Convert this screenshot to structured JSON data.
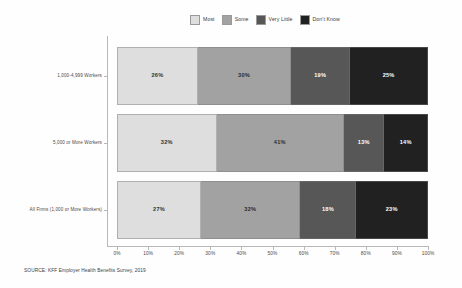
{
  "chart_data": {
    "type": "bar",
    "orientation": "horizontal",
    "stacked": true,
    "title": "",
    "subtitle": "",
    "xlabel": "",
    "ylabel": "",
    "xlim": [
      0,
      100
    ],
    "grid": false,
    "legend_position": "top",
    "categories": [
      "1,000-4,999 Workers",
      "5,000 or More Workers",
      "All Firms (1,000 or More Workers)"
    ],
    "series": [
      {
        "name": "Most",
        "color": "#dedede",
        "text_color": "#333333",
        "values": [
          26,
          32,
          27
        ]
      },
      {
        "name": "Some",
        "color": "#a2a2a2",
        "text_color": "#2b2b2b",
        "values": [
          30,
          41,
          32
        ]
      },
      {
        "name": "Very Little",
        "color": "#575757",
        "text_color": "#ffffff",
        "values": [
          19,
          13,
          18
        ]
      },
      {
        "name": "Don't Know",
        "color": "#212121",
        "text_color": "#ffffff",
        "values": [
          25,
          14,
          23
        ]
      }
    ],
    "value_labels": [
      [
        "26%",
        "30%",
        "19%",
        "25%"
      ],
      [
        "32%",
        "41%",
        "13%",
        "14%"
      ],
      [
        "27%",
        "32%",
        "18%",
        "23%"
      ]
    ],
    "xticks": [
      0,
      10,
      20,
      30,
      40,
      50,
      60,
      70,
      80,
      90,
      100
    ],
    "xticklabels": [
      "0%",
      "10%",
      "20%",
      "30%",
      "40%",
      "50%",
      "60%",
      "70%",
      "80%",
      "90%",
      "100%"
    ]
  },
  "legend": {
    "items": [
      {
        "label": "Most"
      },
      {
        "label": "Some"
      },
      {
        "label": "Very Little"
      },
      {
        "label": "Don't Know"
      }
    ]
  },
  "footer": {
    "source": "SOURCE: KFF Employer Health Benefits Survey, 2019"
  }
}
